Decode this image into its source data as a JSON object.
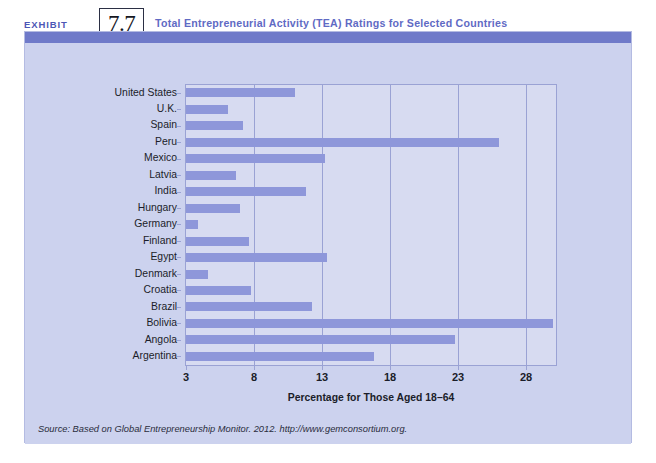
{
  "header": {
    "exhibit_word": "EXHIBIT",
    "exhibit_number": "7.7",
    "title": "Total Entrepreneurial Activity (TEA) Ratings for Selected Countries"
  },
  "source_note": "Source: Based on Global Entrepreneurship Monitor. 2012. http://www.gemconsortium.org.",
  "colors": {
    "bar": "#8e97da",
    "panel": "#ccd2ee",
    "plot_area": "#d7dbf1",
    "band": "#6f7ac9",
    "title_text": "#5f6ac4",
    "grid": "#9aa2d4"
  },
  "chart_data": {
    "type": "bar",
    "orientation": "horizontal",
    "title": "Total Entrepreneurial Activity (TEA) Ratings for Selected Countries",
    "xlabel": "Percentage for Those Aged 18–64",
    "ylabel": "",
    "xlim": [
      3,
      30.5
    ],
    "xticks": [
      3,
      8,
      13,
      18,
      23,
      28
    ],
    "xtick_labels": [
      "3",
      "8",
      "13",
      "18",
      "23",
      "28"
    ],
    "grid": true,
    "legend": null,
    "categories": [
      "United States",
      "U.K.",
      "Spain",
      "Peru",
      "Mexico",
      "Latvia",
      "India",
      "Hungary",
      "Germany",
      "Finland",
      "Egypt",
      "Denmark",
      "Croatia",
      "Brazil",
      "Bolivia",
      "Angola",
      "Argentina"
    ],
    "values": [
      11.0,
      6.1,
      7.2,
      26.0,
      13.2,
      6.7,
      11.8,
      7.0,
      3.9,
      7.6,
      13.4,
      4.6,
      7.8,
      12.3,
      30.0,
      22.8,
      16.8
    ]
  }
}
